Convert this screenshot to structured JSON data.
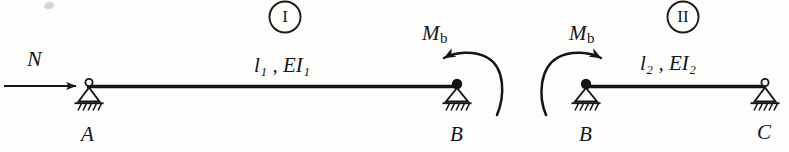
{
  "figure": {
    "background_color": "#fdfdfc",
    "ink_color": "#151515"
  },
  "segments": [
    {
      "id": "I",
      "roman_label": "I",
      "span_label": "l",
      "span_sub": "1",
      "stiffness_label": "EI",
      "stiffness_sub": "1",
      "span_text": "l₁ , EI₁",
      "left_node": "A",
      "right_node": "B"
    },
    {
      "id": "II",
      "roman_label": "II",
      "span_label": "l",
      "span_sub": "2",
      "stiffness_label": "EI",
      "stiffness_sub": "2",
      "span_text": "l₂ , EI₂",
      "left_node": "B",
      "right_node": "C"
    }
  ],
  "loads": {
    "axial_force_label": "N",
    "moment_label": "M",
    "moment_sub": "b",
    "moment_text": "Mb"
  },
  "nodes": [
    {
      "name": "A",
      "label": "A",
      "support": "roller-pin",
      "beam": "I",
      "end": "left"
    },
    {
      "name": "B-left",
      "label": "B",
      "support": "pin-hinge",
      "beam": "I",
      "end": "right"
    },
    {
      "name": "B-right",
      "label": "B",
      "support": "pin-hinge",
      "beam": "II",
      "end": "left"
    },
    {
      "name": "C",
      "label": "C",
      "support": "roller-pin",
      "beam": "II",
      "end": "right"
    }
  ],
  "icons": {
    "axial_arrow": "arrow-right-icon",
    "moment_arc_left": "moment-arc-ccw-icon",
    "moment_arc_right": "moment-arc-cw-icon",
    "support_a": "pin-support-icon",
    "support_b_left": "hinge-support-icon",
    "support_b_right": "hinge-support-icon",
    "support_c": "pin-support-icon"
  }
}
